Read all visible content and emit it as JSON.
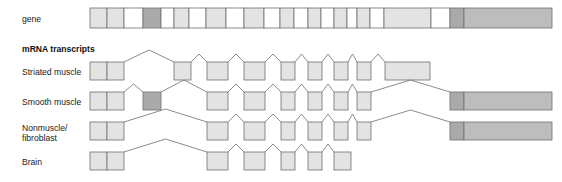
{
  "title_labels": {
    "gene": "gene",
    "transcripts_header": "mRNA transcripts"
  },
  "colors": {
    "exon_light": "#e3e3e3",
    "exon_lighter": "#ebebeb",
    "exon_dark": "#aaaaaa",
    "exon_medium": "#c9c9c9",
    "exon_terminal": "#bdbdbd",
    "outline": "#6f6f6f",
    "text": "#1a1a1a",
    "background": "#ffffff"
  },
  "geometry": {
    "track_left": 90,
    "track_right": 552,
    "gene_y": 8,
    "gene_height": 20,
    "exon_y": 62,
    "exon_height": 18,
    "row_spacing": 30
  },
  "chart_data": {
    "type": "diagram",
    "gene": {
      "label": "gene",
      "y": 8,
      "height": 20,
      "blocks": [
        {
          "x": 90,
          "w": 17,
          "shade": "exon_light"
        },
        {
          "x": 107,
          "w": 17,
          "shade": "exon_light"
        },
        {
          "x": 124,
          "w": 19,
          "shade": "white"
        },
        {
          "x": 143,
          "w": 18,
          "shade": "exon_dark"
        },
        {
          "x": 161,
          "w": 13,
          "shade": "white"
        },
        {
          "x": 174,
          "w": 15,
          "shade": "exon_light"
        },
        {
          "x": 189,
          "w": 17,
          "shade": "white"
        },
        {
          "x": 206,
          "w": 20,
          "shade": "exon_light"
        },
        {
          "x": 226,
          "w": 18,
          "shade": "white"
        },
        {
          "x": 244,
          "w": 20,
          "shade": "exon_light"
        },
        {
          "x": 264,
          "w": 16,
          "shade": "white"
        },
        {
          "x": 280,
          "w": 14,
          "shade": "exon_light"
        },
        {
          "x": 294,
          "w": 14,
          "shade": "white"
        },
        {
          "x": 308,
          "w": 13,
          "shade": "exon_light"
        },
        {
          "x": 321,
          "w": 13,
          "shade": "white"
        },
        {
          "x": 334,
          "w": 13,
          "shade": "exon_light"
        },
        {
          "x": 347,
          "w": 10,
          "shade": "white"
        },
        {
          "x": 357,
          "w": 13,
          "shade": "exon_light"
        },
        {
          "x": 370,
          "w": 14,
          "shade": "white"
        },
        {
          "x": 384,
          "w": 47,
          "shade": "exon_light"
        },
        {
          "x": 431,
          "w": 19,
          "shade": "white"
        },
        {
          "x": 450,
          "w": 14,
          "shade": "exon_dark"
        },
        {
          "x": 464,
          "w": 88,
          "shade": "exon_terminal"
        }
      ]
    },
    "transcripts": [
      {
        "name": "Striated muscle",
        "label_lines": [
          "Striated muscle"
        ],
        "y": 62,
        "height": 18,
        "exons": [
          {
            "x": 90,
            "w": 17,
            "shade": "exon_light"
          },
          {
            "x": 107,
            "w": 17,
            "shade": "exon_light"
          },
          {
            "x": 174,
            "w": 17,
            "shade": "exon_light"
          },
          {
            "x": 207,
            "w": 21,
            "shade": "exon_light"
          },
          {
            "x": 244,
            "w": 21,
            "shade": "exon_light"
          },
          {
            "x": 281,
            "w": 14,
            "shade": "exon_light"
          },
          {
            "x": 308,
            "w": 14,
            "shade": "exon_light"
          },
          {
            "x": 334,
            "w": 14,
            "shade": "exon_light"
          },
          {
            "x": 357,
            "w": 14,
            "shade": "exon_light"
          },
          {
            "x": 385,
            "w": 45,
            "shade": "exon_light"
          }
        ],
        "splices": [
          {
            "from": 124,
            "to": 174,
            "peak": 12
          },
          {
            "from": 191,
            "to": 207,
            "peak": 8
          },
          {
            "from": 228,
            "to": 244,
            "peak": 8
          },
          {
            "from": 265,
            "to": 281,
            "peak": 8
          },
          {
            "from": 295,
            "to": 308,
            "peak": 8
          },
          {
            "from": 322,
            "to": 334,
            "peak": 8
          },
          {
            "from": 348,
            "to": 357,
            "peak": 8
          },
          {
            "from": 371,
            "to": 385,
            "peak": 8
          }
        ]
      },
      {
        "name": "Smooth muscle",
        "label_lines": [
          "Smooth muscle"
        ],
        "y": 92,
        "height": 18,
        "exons": [
          {
            "x": 90,
            "w": 17,
            "shade": "exon_light"
          },
          {
            "x": 107,
            "w": 17,
            "shade": "exon_light"
          },
          {
            "x": 143,
            "w": 18,
            "shade": "exon_dark"
          },
          {
            "x": 207,
            "w": 21,
            "shade": "exon_light"
          },
          {
            "x": 244,
            "w": 21,
            "shade": "exon_light"
          },
          {
            "x": 281,
            "w": 14,
            "shade": "exon_light"
          },
          {
            "x": 308,
            "w": 14,
            "shade": "exon_light"
          },
          {
            "x": 334,
            "w": 14,
            "shade": "exon_light"
          },
          {
            "x": 357,
            "w": 14,
            "shade": "exon_light"
          },
          {
            "x": 450,
            "w": 14,
            "shade": "exon_dark"
          },
          {
            "x": 464,
            "w": 88,
            "shade": "exon_terminal"
          }
        ],
        "splices": [
          {
            "from": 124,
            "to": 143,
            "peak": 8
          },
          {
            "from": 161,
            "to": 207,
            "peak": 12
          },
          {
            "from": 228,
            "to": 244,
            "peak": 8
          },
          {
            "from": 265,
            "to": 281,
            "peak": 8
          },
          {
            "from": 295,
            "to": 308,
            "peak": 8
          },
          {
            "from": 322,
            "to": 334,
            "peak": 8
          },
          {
            "from": 348,
            "to": 357,
            "peak": 8
          },
          {
            "from": 371,
            "to": 450,
            "peak": 12
          }
        ]
      },
      {
        "name": "Nonmuscle/fibroblast",
        "label_lines": [
          "Nonmuscle/",
          "fibroblast"
        ],
        "y": 122,
        "height": 18,
        "exons": [
          {
            "x": 90,
            "w": 17,
            "shade": "exon_light"
          },
          {
            "x": 107,
            "w": 17,
            "shade": "exon_light"
          },
          {
            "x": 207,
            "w": 21,
            "shade": "exon_light"
          },
          {
            "x": 244,
            "w": 21,
            "shade": "exon_light"
          },
          {
            "x": 281,
            "w": 14,
            "shade": "exon_light"
          },
          {
            "x": 308,
            "w": 14,
            "shade": "exon_light"
          },
          {
            "x": 334,
            "w": 14,
            "shade": "exon_light"
          },
          {
            "x": 357,
            "w": 14,
            "shade": "exon_light"
          },
          {
            "x": 450,
            "w": 14,
            "shade": "exon_dark"
          },
          {
            "x": 464,
            "w": 88,
            "shade": "exon_terminal"
          }
        ],
        "splices": [
          {
            "from": 124,
            "to": 207,
            "peak": 13
          },
          {
            "from": 228,
            "to": 244,
            "peak": 8
          },
          {
            "from": 265,
            "to": 281,
            "peak": 8
          },
          {
            "from": 295,
            "to": 308,
            "peak": 8
          },
          {
            "from": 322,
            "to": 334,
            "peak": 8
          },
          {
            "from": 348,
            "to": 357,
            "peak": 8
          },
          {
            "from": 371,
            "to": 450,
            "peak": 12
          }
        ]
      },
      {
        "name": "Brain",
        "label_lines": [
          "Brain"
        ],
        "y": 152,
        "height": 18,
        "exons": [
          {
            "x": 90,
            "w": 17,
            "shade": "exon_light"
          },
          {
            "x": 107,
            "w": 17,
            "shade": "exon_light"
          },
          {
            "x": 207,
            "w": 21,
            "shade": "exon_light"
          },
          {
            "x": 244,
            "w": 21,
            "shade": "exon_light"
          },
          {
            "x": 281,
            "w": 14,
            "shade": "exon_light"
          },
          {
            "x": 308,
            "w": 14,
            "shade": "exon_light"
          },
          {
            "x": 334,
            "w": 17,
            "shade": "exon_light"
          }
        ],
        "splices": [
          {
            "from": 124,
            "to": 207,
            "peak": 13
          },
          {
            "from": 228,
            "to": 244,
            "peak": 8
          },
          {
            "from": 265,
            "to": 281,
            "peak": 8
          },
          {
            "from": 295,
            "to": 308,
            "peak": 8
          },
          {
            "from": 322,
            "to": 334,
            "peak": 8
          }
        ]
      }
    ],
    "label_positions": {
      "gene": {
        "x": 22,
        "y": 22
      },
      "transcripts_header": {
        "x": 22,
        "y": 52
      },
      "rows": [
        {
          "x": 22,
          "y": 75
        },
        {
          "x": 22,
          "y": 105
        },
        {
          "x": 22,
          "y": 131
        },
        {
          "x": 22,
          "y": 165
        }
      ],
      "nonmuscle_second_line_y": 141
    }
  }
}
